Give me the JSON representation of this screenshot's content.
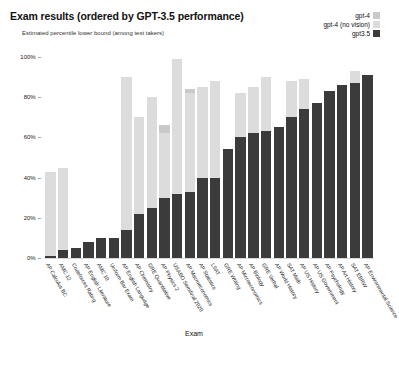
{
  "header": {
    "title": "Exam results (ordered by GPT-3.5 performance)",
    "subtitle": "Estimated percentile lower bound (among test takers)"
  },
  "legend": {
    "position": "top-right",
    "items": [
      {
        "label": "gpt-4",
        "color": "#c9c9c9"
      },
      {
        "label": "gpt-4 (no vision)",
        "color": "#dcdcdc"
      },
      {
        "label": "gpt3.5",
        "color": "#3b3b3b"
      }
    ]
  },
  "chart_data": {
    "type": "bar",
    "title": "Exam results (ordered by GPT-3.5 performance)",
    "subtitle": "Estimated percentile lower bound (among test takers)",
    "xlabel": "Exam",
    "ylabel": "",
    "ylim": [
      0,
      100
    ],
    "yticks": [
      "0%",
      "20%",
      "40%",
      "60%",
      "80%",
      "100%"
    ],
    "ytick_values": [
      0,
      20,
      40,
      60,
      80,
      100
    ],
    "grid": false,
    "legend_position": "top-right",
    "categories": [
      "AP Calculus BC",
      "AMC 12",
      "Codeforces Rating",
      "AP English Literature",
      "AMC 10",
      "Uniform Bar Exam",
      "AP English Language",
      "AP Chemistry",
      "GRE Quantitative",
      "AP Physics 2",
      "USABO Semifinal 2020",
      "AP Macroeconomics",
      "AP Statistics",
      "LSAT",
      "GRE Writing",
      "AP Microeconomics",
      "AP Biology",
      "GRE Verbal",
      "AP World History",
      "SAT Math",
      "AP US History",
      "AP US Government",
      "AP Psychology",
      "AP Art History",
      "SAT EBRW",
      "AP Environmental Science"
    ],
    "series": [
      {
        "name": "gpt-4",
        "color": "#c9c9c9",
        "values": [
          43,
          45,
          5,
          8,
          10,
          10,
          90,
          70,
          80,
          66,
          99,
          84,
          85,
          88,
          54,
          82,
          85,
          90,
          65,
          88,
          89,
          77,
          83,
          86,
          93,
          91
        ]
      },
      {
        "name": "gpt-4 (no vision)",
        "color": "#dcdcdc",
        "values": [
          43,
          45,
          5,
          8,
          10,
          10,
          90,
          70,
          80,
          62,
          99,
          82,
          85,
          88,
          54,
          82,
          85,
          90,
          65,
          88,
          89,
          77,
          83,
          86,
          93,
          91
        ]
      },
      {
        "name": "gpt3.5",
        "color": "#3b3b3b",
        "values": [
          1,
          4,
          5,
          8,
          10,
          10,
          14,
          22,
          25,
          30,
          32,
          33,
          40,
          40,
          54,
          60,
          62,
          63,
          65,
          70,
          74,
          77,
          83,
          86,
          87,
          91
        ]
      }
    ]
  }
}
